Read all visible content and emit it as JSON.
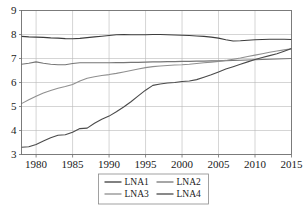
{
  "chart_data": {
    "type": "line",
    "title": "",
    "xlabel": "",
    "ylabel": "",
    "xlim": [
      1978,
      2015
    ],
    "ylim": [
      3,
      9
    ],
    "grid": true,
    "legend_position": "bottom-center",
    "x": [
      1978,
      1979,
      1980,
      1981,
      1982,
      1983,
      1984,
      1985,
      1986,
      1987,
      1988,
      1989,
      1990,
      1991,
      1992,
      1993,
      1994,
      1995,
      1996,
      1997,
      1998,
      1999,
      2000,
      2001,
      2002,
      2003,
      2004,
      2005,
      2006,
      2007,
      2008,
      2009,
      2010,
      2011,
      2012,
      2013,
      2014,
      2015
    ],
    "xticks": [
      1980,
      1985,
      1990,
      1995,
      2000,
      2005,
      2010,
      2015
    ],
    "yticks": [
      3,
      4,
      5,
      6,
      7,
      8,
      9
    ],
    "series": [
      {
        "name": "LNA1",
        "color": "#3d3d3d",
        "values": [
          7.92,
          7.9,
          7.89,
          7.88,
          7.86,
          7.85,
          7.83,
          7.82,
          7.84,
          7.87,
          7.9,
          7.93,
          7.96,
          7.99,
          8.0,
          7.99,
          7.99,
          7.99,
          8.0,
          8.0,
          7.99,
          7.98,
          7.97,
          7.96,
          7.94,
          7.92,
          7.89,
          7.85,
          7.78,
          7.73,
          7.74,
          7.76,
          7.78,
          7.79,
          7.8,
          7.8,
          7.8,
          7.79
        ]
      },
      {
        "name": "LNA2",
        "color": "#767676",
        "values": [
          6.76,
          6.8,
          6.86,
          6.8,
          6.76,
          6.74,
          6.74,
          6.79,
          6.82,
          6.82,
          6.82,
          6.82,
          6.82,
          6.83,
          6.83,
          6.84,
          6.84,
          6.85,
          6.86,
          6.86,
          6.87,
          6.87,
          6.88,
          6.88,
          6.89,
          6.89,
          6.9,
          6.9,
          6.91,
          6.92,
          6.93,
          6.94,
          6.95,
          6.96,
          6.97,
          6.98,
          6.99,
          7.0
        ]
      },
      {
        "name": "LNA3",
        "color": "#8f8f8f",
        "values": [
          5.12,
          5.28,
          5.43,
          5.56,
          5.67,
          5.76,
          5.83,
          5.92,
          6.06,
          6.18,
          6.24,
          6.29,
          6.33,
          6.38,
          6.44,
          6.5,
          6.56,
          6.62,
          6.66,
          6.69,
          6.71,
          6.73,
          6.74,
          6.76,
          6.79,
          6.82,
          6.85,
          6.88,
          6.92,
          6.97,
          7.02,
          7.08,
          7.14,
          7.2,
          7.26,
          7.31,
          7.36,
          7.4
        ]
      },
      {
        "name": "LNA4",
        "color": "#4a4a4a",
        "values": [
          3.3,
          3.32,
          3.42,
          3.56,
          3.7,
          3.8,
          3.82,
          3.93,
          4.08,
          4.1,
          4.3,
          4.47,
          4.6,
          4.78,
          4.98,
          5.2,
          5.44,
          5.68,
          5.88,
          5.94,
          5.98,
          6.0,
          6.04,
          6.06,
          6.12,
          6.22,
          6.32,
          6.44,
          6.56,
          6.66,
          6.76,
          6.86,
          6.96,
          7.04,
          7.12,
          7.2,
          7.3,
          7.42
        ]
      }
    ]
  },
  "legend": {
    "entries": [
      {
        "label": "LNA1"
      },
      {
        "label": "LNA2"
      },
      {
        "label": "LNA3"
      },
      {
        "label": "LNA4"
      }
    ]
  }
}
